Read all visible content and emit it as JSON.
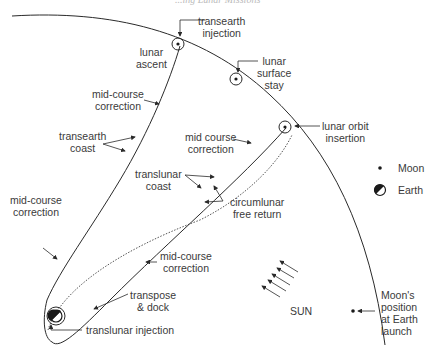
{
  "header": {
    "running_text": "...ing Lunar Missions"
  },
  "labels": {
    "transearth_injection": [
      "transearth",
      "injection"
    ],
    "lunar_ascent": [
      "lunar",
      "ascent"
    ],
    "lunar_surface_stay": [
      "lunar",
      "surface",
      "stay"
    ],
    "mid_course_correction_top": [
      "mid-course",
      "correction"
    ],
    "transearth_coast": [
      "transearth",
      "coast"
    ],
    "mid_course_correction_right": [
      "mid course",
      "correction"
    ],
    "lunar_orbit_insertion": [
      "lunar orbit",
      "insertion"
    ],
    "translunar_coast": [
      "translunar",
      "coast"
    ],
    "circumlunar_free_return": [
      "circumlunar",
      "free return"
    ],
    "mid_course_correction_left": [
      "mid-course",
      "correction"
    ],
    "mid_course_correction_bottom": [
      "mid-course",
      "correction"
    ],
    "transpose_dock": [
      "transpose",
      "& dock"
    ],
    "translunar_injection": "translunar injection",
    "sun": "SUN",
    "moon_position_launch": [
      "Moon's",
      "position",
      "at Earth",
      "launch"
    ]
  },
  "legend": {
    "moon": {
      "symbol": "small-dot",
      "label": "Moon"
    },
    "earth": {
      "symbol": "half-filled-circle",
      "label": "Earth"
    }
  },
  "colors": {
    "line": "#2a2a2a",
    "text": "#3a3a3a",
    "background": "#ffffff"
  }
}
